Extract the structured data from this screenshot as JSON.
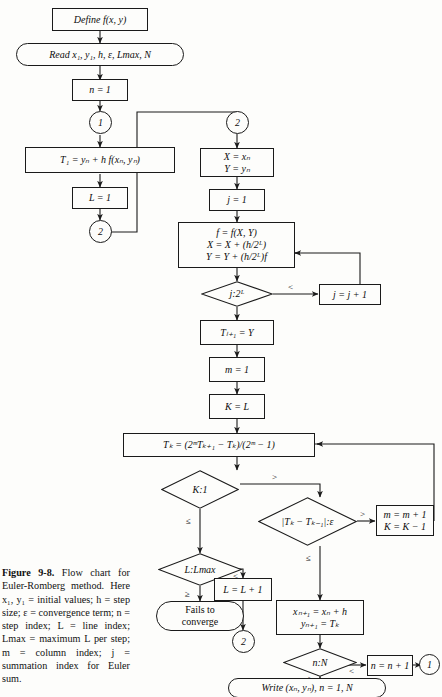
{
  "figure": {
    "caption_label": "Figure 9-8.",
    "caption_text": " Flow chart for Euler-Romberg method. Here x₁, y₁ = initial values; h = step size; ε = convergence term; n = step index; L = line index; Lmax = maximum L per step; m = column index; j = summation index for Euler sum."
  },
  "nodes": {
    "define": "Define f(x, y)",
    "read": "Read x₁, y₁, h, ε, Lmax, N",
    "n_init": "n = 1",
    "conn_1_top": "1",
    "t1": "T₁ = yₙ + h f(xₙ, yₙ)",
    "l_init": "L = 1",
    "conn_2_left": "2",
    "conn_2_right": "2",
    "xy_init_line1": "X = xₙ",
    "xy_init_line2": "Y = yₙ",
    "j_init": "j = 1",
    "euler_line1": "f = f(X, Y)",
    "euler_line2": "X = X + (h/2ᴸ)",
    "euler_line3": "Y = Y + (h/2ᴸ)f",
    "dec_j": "j:2ᴸ",
    "j_inc": "j = j + 1",
    "tl1": "Tₗ₊₁ = Y",
    "m_init": "m = 1",
    "k_init": "K = L",
    "romberg": "Tₖ = (2ᵐTₖ₊₁ − Tₖ)/(2ᵐ − 1)",
    "dec_k1": "K:1",
    "dec_eps": "|Tₖ − Tₖ₋₁|:ε",
    "m_inc_line1": "m = m + 1",
    "m_inc_line2": "K = K − 1",
    "dec_lmax": "L:Lmax",
    "l_inc": "L = L + 1",
    "fails_line1": "Fails to",
    "fails_line2": "converge",
    "conn_2_bottom": "2",
    "step_line1": "xₙ₊₁ = xₙ + h",
    "step_line2": "yₙ₊₁ = Tₖ",
    "dec_nN": "n:N",
    "n_inc": "n = n + 1",
    "conn_1_right": "1",
    "write": "Write (xₙ, yₙ), n = 1, N"
  },
  "edge_labels": {
    "j_lt": "<",
    "k1_gt": ">",
    "k1_le": "≤",
    "eps_gt": ">",
    "eps_le": "≤",
    "lmax_lt": "<",
    "lmax_ge": "≥",
    "nN_lt": "<",
    "nN_ge": "≥"
  },
  "style": {
    "ink": "#1a1a1a",
    "paper": "#fdfdfb"
  }
}
